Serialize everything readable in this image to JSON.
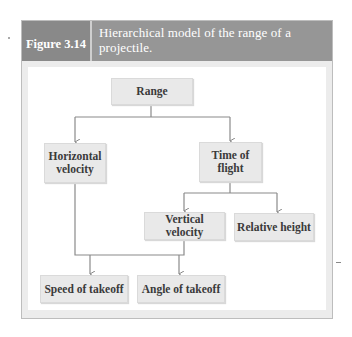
{
  "figure": {
    "label": "Figure 3.14",
    "title": "Hierarchical model of the range of a projectile."
  },
  "diagram": {
    "type": "hierarchical-model",
    "nodes": {
      "range": "Range",
      "horizontal_velocity": "Horizontal velocity",
      "time_of_flight": "Time of flight",
      "vertical_velocity": "Vertical velocity",
      "relative_height": "Relative height",
      "speed_of_takeoff": "Speed of takeoff",
      "angle_of_takeoff": "Angle of takeoff"
    },
    "edges": [
      [
        "Range",
        "Horizontal velocity"
      ],
      [
        "Range",
        "Time of flight"
      ],
      [
        "Time of flight",
        "Vertical velocity"
      ],
      [
        "Time of flight",
        "Relative height"
      ],
      [
        "Horizontal velocity",
        "Speed of takeoff"
      ],
      [
        "Horizontal velocity",
        "Angle of takeoff"
      ],
      [
        "Vertical velocity",
        "Speed of takeoff"
      ],
      [
        "Vertical velocity",
        "Angle of takeoff"
      ]
    ]
  },
  "colors": {
    "header_label_bg": "#898989",
    "header_title_bg": "#969696",
    "node_bg": "#e9e9e9",
    "connector": "#888888"
  }
}
